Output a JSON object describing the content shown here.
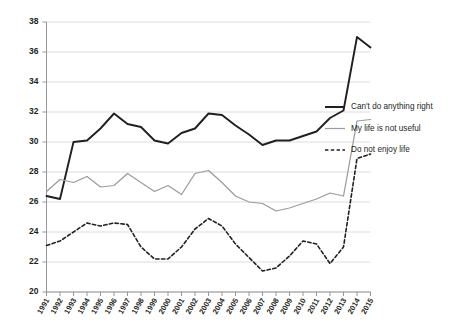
{
  "chart_data": {
    "type": "line",
    "title": "",
    "subtitle": "",
    "xlabel": "",
    "ylabel": "",
    "x": [
      1991,
      1992,
      1993,
      1994,
      1995,
      1996,
      1997,
      1998,
      1999,
      2000,
      2001,
      2002,
      2003,
      2004,
      2005,
      2006,
      2007,
      2008,
      2009,
      2010,
      2011,
      2012,
      2013,
      2014,
      2015
    ],
    "xtick_labels": [
      "1991",
      "1992",
      "1993",
      "1994",
      "1995",
      "1996",
      "1997",
      "1998",
      "1999",
      "2000",
      "2001",
      "2002",
      "2003",
      "2004",
      "2005",
      "2006",
      "2007",
      "2008",
      "2009",
      "2010",
      "2011",
      "2012",
      "2013",
      "2014",
      "2015"
    ],
    "ylim": [
      20,
      38
    ],
    "ytick_labels": [
      "20",
      "22",
      "24",
      "26",
      "28",
      "30",
      "32",
      "34",
      "36",
      "38"
    ],
    "ytick_values": [
      20,
      22,
      24,
      26,
      28,
      30,
      32,
      34,
      36,
      38
    ],
    "grid": true,
    "legend_position": "right",
    "series": [
      {
        "name": "Can't do anything right",
        "style": "solid-thick",
        "color": "#231f20",
        "values": [
          26.4,
          26.2,
          30.0,
          30.1,
          30.9,
          31.9,
          31.2,
          31.0,
          30.1,
          29.9,
          30.6,
          30.9,
          31.9,
          31.8,
          31.1,
          30.5,
          29.8,
          30.1,
          30.1,
          30.4,
          30.7,
          31.6,
          32.1,
          37.0,
          36.3
        ]
      },
      {
        "name": "My life is not useful",
        "style": "solid-thin",
        "color": "#9b9b9b",
        "values": [
          26.7,
          27.5,
          27.3,
          27.7,
          27.0,
          27.1,
          27.9,
          27.3,
          26.7,
          27.1,
          26.5,
          27.9,
          28.1,
          27.3,
          26.4,
          26.0,
          25.9,
          25.4,
          25.6,
          25.9,
          26.2,
          26.6,
          26.4,
          31.4,
          31.5
        ]
      },
      {
        "name": "Do not enjoy life",
        "style": "dashed",
        "color": "#231f20",
        "values": [
          23.1,
          23.4,
          24.0,
          24.6,
          24.4,
          24.6,
          24.5,
          23.0,
          22.2,
          22.2,
          23.0,
          24.2,
          24.9,
          24.4,
          23.2,
          22.3,
          21.4,
          21.6,
          22.4,
          23.4,
          23.2,
          21.9,
          23.0,
          28.9,
          29.2
        ]
      }
    ]
  },
  "legend": {
    "items": [
      {
        "label": "Can't do anything right"
      },
      {
        "label": "My life is not useful"
      },
      {
        "label": "Do not enjoy life"
      }
    ]
  }
}
